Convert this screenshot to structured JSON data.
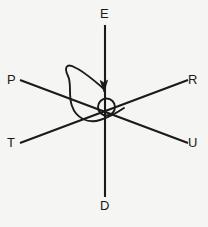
{
  "figure": {
    "type": "vector-diagram",
    "background_color": "#f5f5f3",
    "stroke_color": "#1a1a1a",
    "labels": {
      "up": "E",
      "down": "D",
      "left_upper": "P",
      "right_upper": "R",
      "left_lower": "T",
      "right_lower": "U"
    },
    "elements": {
      "vertical_axis_name": "vertical-axis-E-D",
      "diagonal_axis_1_name": "diagonal-axis-P-U",
      "diagonal_axis_2_name": "diagonal-axis-T-R",
      "origin_marker_name": "origin-circle",
      "rotation_arrow_name": "rotation-loop-arrow"
    }
  }
}
